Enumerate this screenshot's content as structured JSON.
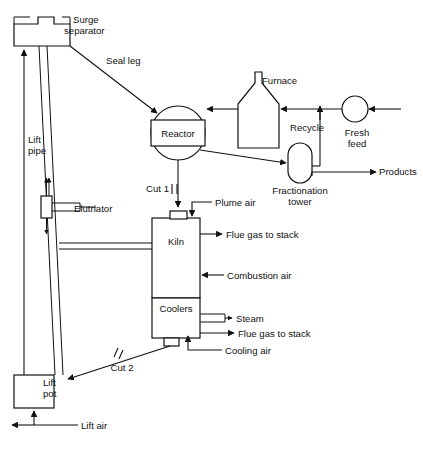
{
  "diagram": {
    "type": "process-flow-diagram",
    "background_color": "#ffffff",
    "line_color": "#111111",
    "equipment": [
      {
        "id": "surge-separator",
        "label_line1": "Surge",
        "label_line2": "separator",
        "shape": "rectangle-with-two-top-nozzles"
      },
      {
        "id": "reactor",
        "label": "Reactor",
        "shape": "circle-with-center-band"
      },
      {
        "id": "furnace",
        "label": "Furnace",
        "shape": "house-with-stack"
      },
      {
        "id": "fractionation-tower",
        "label_line1": "Fractionation",
        "label_line2": "tower",
        "shape": "vertical-stadium"
      },
      {
        "id": "fresh-feed-pump",
        "label_line1": "Fresh",
        "label_line2": "feed",
        "shape": "circle"
      },
      {
        "id": "kiln",
        "label": "Kiln",
        "shape": "rectangle"
      },
      {
        "id": "coolers",
        "label": "Coolers",
        "shape": "rectangle"
      },
      {
        "id": "lift-pot",
        "label_line1": "Lift",
        "label_line2": "pot",
        "shape": "square"
      },
      {
        "id": "elutriator",
        "label": "Elutriator",
        "shape": "vertical-valve-with-double-arrow"
      },
      {
        "id": "lift-pipe",
        "label_line1": "Lift",
        "label_line2": "pipe",
        "shape": "vertical-line-with-up-arrow"
      }
    ],
    "stream_labels": [
      {
        "id": "seal-leg",
        "text": "Seal leg"
      },
      {
        "id": "cut-1",
        "text": "Cut 1"
      },
      {
        "id": "cut-2",
        "text": "Cut 2"
      },
      {
        "id": "recycle",
        "text": "Recycle"
      },
      {
        "id": "products",
        "text": "Products"
      },
      {
        "id": "plume-air",
        "text": "Plume air"
      },
      {
        "id": "flue-gas-kiln",
        "text": "Flue gas to stack"
      },
      {
        "id": "combustion-air",
        "text": "Combustion air"
      },
      {
        "id": "steam",
        "text": "Steam"
      },
      {
        "id": "flue-gas-coolers",
        "text": "Flue gas to stack"
      },
      {
        "id": "cooling-air",
        "text": "Cooling air"
      },
      {
        "id": "lift-air",
        "text": "Lift air"
      }
    ],
    "labels": {
      "surge_separator_1": "Surge",
      "surge_separator_2": "separator",
      "seal_leg": "Seal leg",
      "lift_pipe_1": "Lift",
      "lift_pipe_2": "pipe",
      "elutriator": "Elutriator",
      "reactor": "Reactor",
      "furnace": "Furnace",
      "recycle": "Recycle",
      "fresh_feed_1": "Fresh",
      "fresh_feed_2": "feed",
      "fractionation_1": "Fractionation",
      "fractionation_2": "tower",
      "products": "Products",
      "cut_1": "Cut 1",
      "cut_2": "Cut 2",
      "plume_air": "Plume air",
      "kiln": "Kiln",
      "flue_gas_kiln": "Flue gas to stack",
      "combustion_air": "Combustion air",
      "coolers": "Coolers",
      "steam": "Steam",
      "flue_gas_coolers": "Flue gas to stack",
      "cooling_air": "Cooling air",
      "lift_pot_1": "Lift",
      "lift_pot_2": "pot",
      "lift_air": "Lift air"
    }
  }
}
